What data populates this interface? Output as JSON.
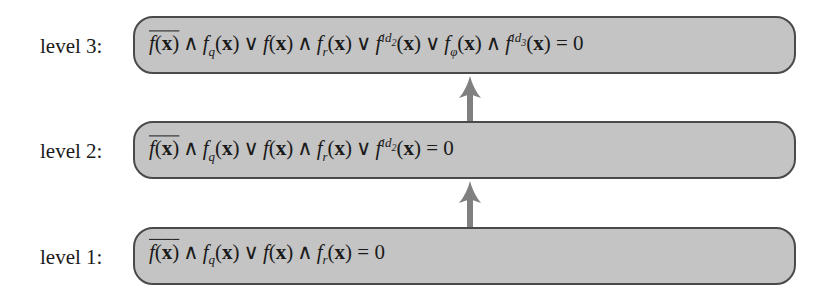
{
  "diagram": {
    "levels": [
      {
        "label": "level 3:",
        "formula": "overline(f(x)) ∧ f_q(x) ∨ f(x) ∧ f_r(x) ∨ f^{id_2}(x) ∨ f_φ(x) ∧ f^{id_3}(x) = 0"
      },
      {
        "label": "level 2:",
        "formula": "overline(f(x)) ∧ f_q(x) ∨ f(x) ∧ f_r(x) ∨ f^{id_2}(x) = 0"
      },
      {
        "label": "level 1:",
        "formula": "overline(f(x)) ∧ f_q(x) ∨ f(x) ∧ f_r(x) = 0"
      }
    ],
    "tokens": {
      "f": "f",
      "x": "x",
      "lp": "(",
      "rp": ")",
      "and": "∧",
      "or": "∨",
      "eq": "= 0",
      "q": "q",
      "r": "r",
      "phi": "φ",
      "id": "id",
      "two": "2",
      "three": "3"
    },
    "arrows": [
      {
        "from": "level 1",
        "to": "level 2"
      },
      {
        "from": "level 2",
        "to": "level 3"
      }
    ],
    "colors": {
      "box_fill": "#c4c4c4",
      "box_border": "#4a4a4a",
      "arrow": "#808080"
    }
  }
}
